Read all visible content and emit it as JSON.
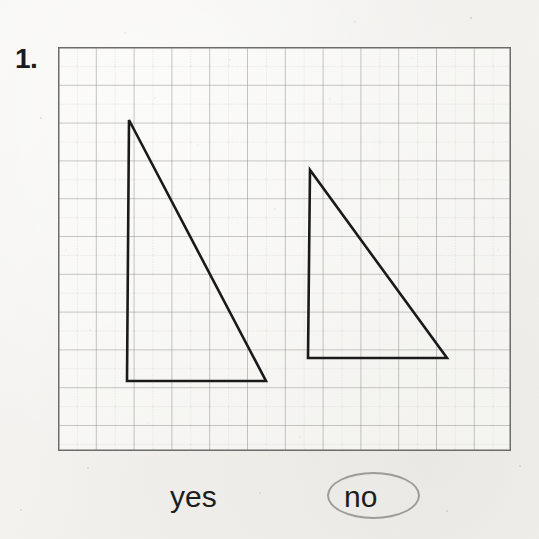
{
  "worksheet": {
    "question_number": "1.",
    "answers": [
      {
        "id": "yes",
        "label": "yes",
        "selected": false
      },
      {
        "id": "no",
        "label": "no",
        "selected": true
      }
    ],
    "selection_marker": "ellipse-circled"
  },
  "grid": {
    "left": 58,
    "top": 47,
    "width": 453,
    "height": 404,
    "cell_size": 18.9,
    "major_every": 2,
    "border_color": "#6f6f6f",
    "major_line_color": "#9a9a9a",
    "minor_line_color": "#c9c9c9",
    "columns": 24,
    "rows": 21
  },
  "figures": [
    {
      "name": "triangle-left",
      "type": "right-triangle",
      "stroke_color": "#1a1a1a",
      "stroke_width": 2.6,
      "vertices": [
        {
          "label": "apex",
          "x": 129,
          "y": 120
        },
        {
          "label": "bottom-left",
          "x": 127,
          "y": 381
        },
        {
          "label": "bottom-right",
          "x": 266,
          "y": 381
        }
      ],
      "leg_vertical_cells": 14,
      "leg_horizontal_cells": 7
    },
    {
      "name": "triangle-right",
      "type": "right-triangle",
      "stroke_color": "#1a1a1a",
      "stroke_width": 2.6,
      "vertices": [
        {
          "label": "apex",
          "x": 310,
          "y": 170
        },
        {
          "label": "bottom-left",
          "x": 308,
          "y": 358
        },
        {
          "label": "bottom-right",
          "x": 447,
          "y": 358
        }
      ],
      "leg_vertical_cells": 10,
      "leg_horizontal_cells": 7
    }
  ],
  "colors": {
    "paper": "#f4f3f1",
    "ink": "#1a1a1a",
    "pencil_circle": "#9d9c99"
  }
}
